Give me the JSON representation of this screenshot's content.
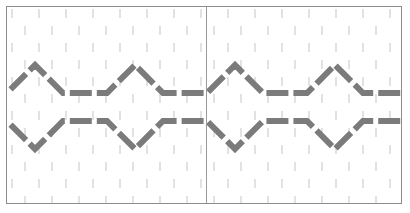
{
  "figure": {
    "title": "",
    "width": 410,
    "height": 213,
    "background_color": "#ffffff"
  },
  "frame": {
    "name": "canvas-frame",
    "x": 6,
    "y": 6,
    "width": 396,
    "height": 198,
    "border_color": "#8c8c8c",
    "border_width": 1,
    "fill_color": "#ffffff"
  },
  "texture": {
    "name": "dash-grid-texture",
    "tick_color": "#e2e2e2",
    "tick_width": 2,
    "tick_height": 9,
    "column_spacing": 27,
    "row_spacing": 17,
    "row_offset": 13,
    "columns": 16,
    "rows": 13
  },
  "divider": {
    "name": "center-vertical-divider",
    "x": 199,
    "color": "#9a9a9a",
    "width": 1,
    "top": 0,
    "bottom": 198
  },
  "pattern": {
    "name": "diamond-chain-pattern",
    "stroke_color": "#7b7b7b",
    "stroke_width": 6,
    "dash_pattern": "22 5",
    "upper_line_y": 86,
    "lower_line_y": 114,
    "period": 100,
    "apex_rise": 28,
    "half_width": 28,
    "repeats": 4,
    "start_x": -22
  },
  "chart_data": {
    "type": "line",
    "title": "",
    "xlabel": "",
    "ylabel": "",
    "grid": true,
    "legend": "none",
    "xlim": [
      0,
      396
    ],
    "ylim": [
      0,
      198
    ],
    "series": [
      {
        "name": "upper-chevron-line",
        "x": [
          -22,
          28,
          78,
          128,
          178,
          228,
          278,
          328,
          378,
          420
        ],
        "y": [
          86,
          86,
          58,
          86,
          86,
          86,
          58,
          86,
          86,
          86
        ]
      },
      {
        "name": "lower-chevron-line",
        "x": [
          -22,
          28,
          78,
          128,
          178,
          228,
          278,
          328,
          378,
          420
        ],
        "y": [
          114,
          114,
          142,
          114,
          114,
          114,
          142,
          114,
          114,
          114
        ]
      }
    ]
  }
}
